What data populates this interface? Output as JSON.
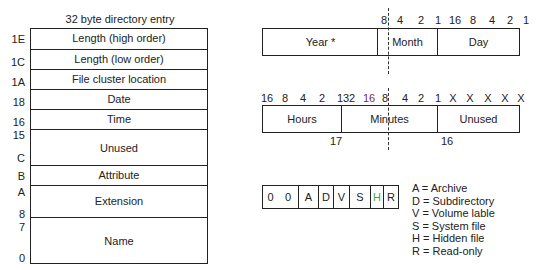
{
  "directory_entry": {
    "title": "32 byte directory entry",
    "rows": [
      {
        "label": "Length (high order)",
        "offset": "1E"
      },
      {
        "label": "Length (low order)",
        "offset": "1C"
      },
      {
        "label": "File cluster location",
        "offset": "1A"
      },
      {
        "label": "Date",
        "offset": "18"
      },
      {
        "label": "Time",
        "offset": "16"
      },
      {
        "label": "Unused",
        "offset_top": "15",
        "offset_bottom": "C"
      },
      {
        "label": "Attribute",
        "offset": "B"
      },
      {
        "label": "Extension",
        "offset_top": "A",
        "offset_bottom": "8"
      },
      {
        "label": "Name",
        "offset_top": "7",
        "offset_bottom": "0"
      }
    ]
  },
  "date_field": {
    "bits": [
      "8",
      "4",
      "2",
      "1",
      "16",
      "8",
      "4",
      "2",
      "1"
    ],
    "fields": [
      "Year *",
      "Month",
      "Day"
    ]
  },
  "time_field": {
    "bits": [
      "16",
      "8",
      "4",
      "2",
      "1",
      "32",
      "16",
      "8",
      "4",
      "2",
      "1",
      "X",
      "X",
      "X",
      "X",
      "X"
    ],
    "fields": [
      "Hours",
      "Minutes",
      "Unused"
    ],
    "byte_labels": [
      "17",
      "16"
    ]
  },
  "attribute_byte": {
    "bits": [
      "0",
      "0",
      "A",
      "D",
      "V",
      "S",
      "H",
      "R"
    ],
    "highlight_color": "#3aa845"
  },
  "legend": [
    "A = Archive",
    "D = Subdirectory",
    "V = Volume lable",
    "S = System file",
    "H = Hidden file",
    "R = Read-only"
  ]
}
